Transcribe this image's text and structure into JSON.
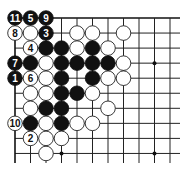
{
  "board": {
    "region": "top-left corner",
    "cols": 11,
    "rows": 10,
    "origin_x": 15,
    "origin_y": 18,
    "spacing_x": 15.5,
    "spacing_y": 15.05,
    "line_extend_right": 180,
    "line_extend_bottom": 163,
    "stone_radius": 7.3,
    "colors": {
      "black": "#111111",
      "white": "#ffffff",
      "line": "#222222"
    },
    "star_points": [
      [
        3,
        3
      ],
      [
        9,
        3
      ],
      [
        3,
        9
      ],
      [
        9,
        9
      ]
    ],
    "stones": [
      {
        "c": 0,
        "r": 0,
        "color": "B",
        "label": "11"
      },
      {
        "c": 1,
        "r": 0,
        "color": "B",
        "label": "5"
      },
      {
        "c": 2,
        "r": 0,
        "color": "B",
        "label": "9"
      },
      {
        "c": 0,
        "r": 1,
        "color": "W",
        "label": "8"
      },
      {
        "c": 1,
        "r": 1,
        "color": "W",
        "label": ""
      },
      {
        "c": 2,
        "r": 1,
        "color": "B",
        "label": "3"
      },
      {
        "c": 4,
        "r": 1,
        "color": "W",
        "label": ""
      },
      {
        "c": 5,
        "r": 1,
        "color": "W",
        "label": ""
      },
      {
        "c": 7,
        "r": 1,
        "color": "W",
        "label": ""
      },
      {
        "c": 1,
        "r": 2,
        "color": "W",
        "label": "4"
      },
      {
        "c": 2,
        "r": 2,
        "color": "B",
        "label": ""
      },
      {
        "c": 3,
        "r": 2,
        "color": "B",
        "label": ""
      },
      {
        "c": 4,
        "r": 2,
        "color": "W",
        "label": ""
      },
      {
        "c": 5,
        "r": 2,
        "color": "B",
        "label": ""
      },
      {
        "c": 6,
        "r": 2,
        "color": "W",
        "label": ""
      },
      {
        "c": 0,
        "r": 3,
        "color": "B",
        "label": "7"
      },
      {
        "c": 1,
        "r": 3,
        "color": "B",
        "label": ""
      },
      {
        "c": 2,
        "r": 3,
        "color": "W",
        "label": ""
      },
      {
        "c": 3,
        "r": 3,
        "color": "B",
        "label": ""
      },
      {
        "c": 4,
        "r": 3,
        "color": "B",
        "label": ""
      },
      {
        "c": 5,
        "r": 3,
        "color": "B",
        "label": ""
      },
      {
        "c": 6,
        "r": 3,
        "color": "B",
        "label": ""
      },
      {
        "c": 7,
        "r": 3,
        "color": "W",
        "label": ""
      },
      {
        "c": 0,
        "r": 4,
        "color": "B",
        "label": "1"
      },
      {
        "c": 1,
        "r": 4,
        "color": "W",
        "label": "6"
      },
      {
        "c": 2,
        "r": 4,
        "color": "W",
        "label": ""
      },
      {
        "c": 3,
        "r": 4,
        "color": "B",
        "label": ""
      },
      {
        "c": 5,
        "r": 4,
        "color": "B",
        "label": ""
      },
      {
        "c": 6,
        "r": 4,
        "color": "W",
        "label": ""
      },
      {
        "c": 7,
        "r": 4,
        "color": "W",
        "label": ""
      },
      {
        "c": 1,
        "r": 5,
        "color": "W",
        "label": ""
      },
      {
        "c": 2,
        "r": 5,
        "color": "W",
        "label": ""
      },
      {
        "c": 3,
        "r": 5,
        "color": "B",
        "label": ""
      },
      {
        "c": 4,
        "r": 5,
        "color": "B",
        "label": ""
      },
      {
        "c": 5,
        "r": 5,
        "color": "W",
        "label": ""
      },
      {
        "c": 1,
        "r": 6,
        "color": "W",
        "label": ""
      },
      {
        "c": 2,
        "r": 6,
        "color": "B",
        "label": ""
      },
      {
        "c": 3,
        "r": 6,
        "color": "B",
        "label": ""
      },
      {
        "c": 6,
        "r": 6,
        "color": "W",
        "label": ""
      },
      {
        "c": 0,
        "r": 7,
        "color": "W",
        "label": "10"
      },
      {
        "c": 1,
        "r": 7,
        "color": "B",
        "label": ""
      },
      {
        "c": 2,
        "r": 7,
        "color": "W",
        "label": ""
      },
      {
        "c": 3,
        "r": 7,
        "color": "B",
        "label": ""
      },
      {
        "c": 4,
        "r": 7,
        "color": "W",
        "label": ""
      },
      {
        "c": 5,
        "r": 7,
        "color": "W",
        "label": ""
      },
      {
        "c": 1,
        "r": 8,
        "color": "W",
        "label": "2"
      },
      {
        "c": 2,
        "r": 8,
        "color": "W",
        "label": ""
      },
      {
        "c": 3,
        "r": 8,
        "color": "W",
        "label": ""
      },
      {
        "c": 2,
        "r": 9,
        "color": "W",
        "label": ""
      }
    ]
  }
}
